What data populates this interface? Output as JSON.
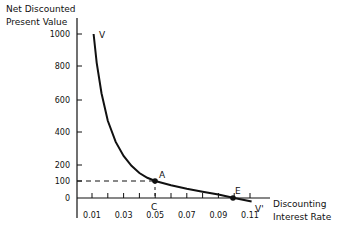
{
  "chart_data": {
    "type": "line",
    "title": "",
    "ylabel_lines": [
      "Net Discounted",
      "Present Value"
    ],
    "xlabel_lines": [
      "Discounting",
      "Interest Rate"
    ],
    "yticks": [
      0,
      100,
      200,
      400,
      600,
      800,
      1000
    ],
    "ytick_labels": [
      "0",
      "100",
      "200",
      "400",
      "600",
      "800",
      "1000"
    ],
    "xticks": [
      0.01,
      0.02,
      0.03,
      0.04,
      0.05,
      0.06,
      0.07,
      0.08,
      0.09,
      0.1,
      0.11
    ],
    "xtick_labels": [
      "0.01",
      "0.03",
      "0.05",
      "0.07",
      "0.09",
      "0.11"
    ],
    "xtick_label_values": [
      0.01,
      0.03,
      0.05,
      0.07,
      0.09,
      0.11
    ],
    "xlim": [
      0.0,
      0.11
    ],
    "ylim": [
      0,
      1000
    ],
    "grid": false,
    "series": [
      {
        "name": "V-V'",
        "x": [
          0.011,
          0.013,
          0.016,
          0.02,
          0.025,
          0.03,
          0.035,
          0.04,
          0.045,
          0.05,
          0.06,
          0.07,
          0.08,
          0.09,
          0.1,
          0.111
        ],
        "y": [
          1000,
          820,
          640,
          470,
          340,
          255,
          195,
          150,
          120,
          100,
          75,
          55,
          37,
          20,
          0,
          -20
        ]
      }
    ],
    "annotations": [
      {
        "label": "V",
        "x": 0.012,
        "y": 1000
      },
      {
        "label": "V'",
        "x": 0.112,
        "y": -20
      },
      {
        "label": "A",
        "x": 0.05,
        "y": 100
      },
      {
        "label": "C",
        "x": 0.05,
        "y": 0
      },
      {
        "label": "E",
        "x": 0.1,
        "y": 0
      }
    ],
    "reference_lines": [
      {
        "type": "horizontal-dashed",
        "y": 100,
        "x_from": 0.0,
        "x_to": 0.05
      },
      {
        "type": "vertical-dashed",
        "x": 0.05,
        "y_from": 0,
        "y_to": 100
      }
    ],
    "points": [
      {
        "label": "A",
        "x": 0.05,
        "y": 100
      },
      {
        "label": "E",
        "x": 0.1,
        "y": 0
      }
    ]
  }
}
